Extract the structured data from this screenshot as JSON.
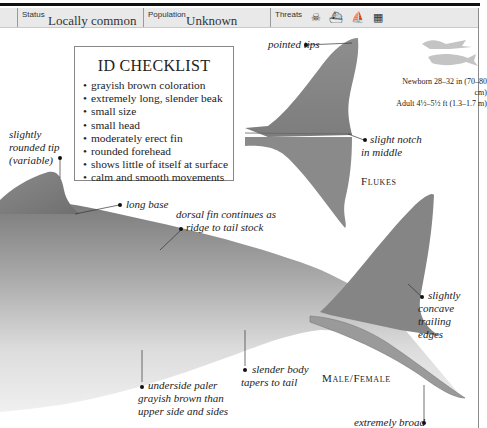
{
  "header": {
    "status": {
      "label": "Status",
      "value": "Locally common"
    },
    "population": {
      "label": "Population",
      "value": "Unknown"
    },
    "threats": {
      "label": "Threats",
      "icons": [
        "skull-pollution-icon",
        "fishing-boat-icon",
        "hunting-boat-icon",
        "fishing-net-icon"
      ]
    }
  },
  "checklist": {
    "title": "ID CHECKLIST",
    "items": [
      "grayish brown coloration",
      "extremely long, slender beak",
      "small size",
      "small head",
      "moderately erect fin",
      "rounded forehead",
      "shows little of itself at surface",
      "calm and smooth movements"
    ]
  },
  "size": {
    "newborn": "Newborn 28–32 in (70–80 cm)",
    "adult": "Adult 4½–5½ ft (1.3–1.7 m)"
  },
  "flukes": {
    "caption": "Flukes",
    "labels": {
      "pointed_tips": "pointed tips",
      "notch_1": "slight notch",
      "notch_2": "in middle"
    }
  },
  "body": {
    "caption": "Male/Female",
    "labels": {
      "tip_1": "slightly",
      "tip_2": "rounded tip",
      "tip_3": "(variable)",
      "long_base": "long base",
      "ridge_1": "dorsal fin continues as",
      "ridge_2": "ridge to tail stock",
      "concave_1": "slightly",
      "concave_2": "concave",
      "concave_3": "trailing",
      "concave_4": "edges",
      "slender_1": "slender body",
      "slender_2": "tapers to tail",
      "underside_1": "underside paler",
      "underside_2": "grayish brown than",
      "underside_3": "upper side and sides",
      "broad": "extremely broad"
    }
  },
  "colors": {
    "header_bg": "#e9e9e9",
    "body_gray": "#8c8c8c",
    "belly": "#e6e6e6",
    "text": "#222222"
  }
}
